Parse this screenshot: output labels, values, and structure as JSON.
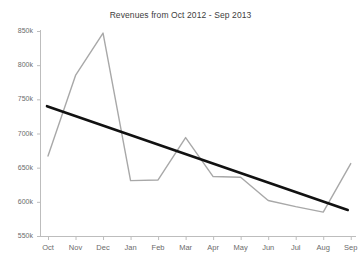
{
  "chart_data": {
    "type": "line",
    "title": "Revenues from Oct 2012 - Sep 2013",
    "xlabel": "",
    "ylabel": "",
    "categories": [
      "Oct",
      "Nov",
      "Dec",
      "Jan",
      "Feb",
      "Mar",
      "Apr",
      "May",
      "Jun",
      "Jul",
      "Aug",
      "Sep"
    ],
    "ylim": [
      550000,
      850000
    ],
    "ytick_labels": [
      "850k",
      "800k",
      "750k",
      "700k",
      "650k",
      "600k",
      "550k"
    ],
    "ytick_values": [
      850000,
      800000,
      750000,
      700000,
      650000,
      600000,
      550000
    ],
    "grid": false,
    "legend": "none",
    "series": [
      {
        "name": "Revenue",
        "type": "line",
        "color": "#a8a8a8",
        "values": [
          667000,
          785000,
          847000,
          631000,
          632000,
          694000,
          637000,
          636000,
          602000,
          593000,
          585000,
          656000
        ]
      },
      {
        "name": "Trendline",
        "type": "line",
        "color": "#111111",
        "values": [
          740000,
          726000,
          712000,
          698000,
          685000,
          671000,
          657000,
          643000,
          629000,
          616000,
          602000,
          588000
        ]
      }
    ]
  }
}
